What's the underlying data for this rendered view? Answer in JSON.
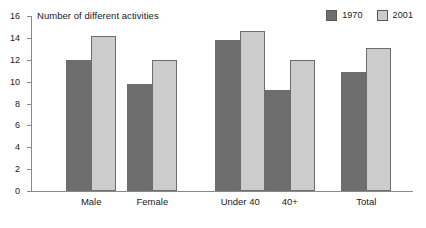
{
  "chart_data": {
    "type": "bar",
    "title": "Number of different activities",
    "xlabel": "",
    "ylabel": "",
    "ylim": [
      0,
      16
    ],
    "yticks": [
      0,
      2,
      4,
      6,
      8,
      10,
      12,
      14,
      16
    ],
    "grid": false,
    "legend_position": "top-right",
    "categories": [
      "Male",
      "Female",
      "Under 40",
      "40+",
      "Total"
    ],
    "series": [
      {
        "name": "1970",
        "color": "#6e6e6e",
        "values": [
          12.0,
          9.8,
          13.8,
          9.2,
          10.9
        ]
      },
      {
        "name": "2001",
        "color": "#cccccc",
        "values": [
          14.2,
          12.0,
          14.6,
          12.0,
          13.1
        ]
      }
    ]
  },
  "legend": {
    "items": [
      {
        "label": "1970",
        "color": "#6e6e6e"
      },
      {
        "label": "2001",
        "color": "#cccccc"
      }
    ]
  },
  "axis": {
    "title": "Number of different activities",
    "y_tick_labels": [
      "16",
      "14",
      "12",
      "10",
      "8",
      "6",
      "4",
      "2",
      "0"
    ]
  },
  "categories": [
    "Male",
    "Female",
    "Under 40",
    "40+",
    "Total"
  ],
  "colors": {
    "series_1970": "#6e6e6e",
    "series_2001": "#cccccc",
    "bar_border": "#6d6d6d",
    "axis": "#8a8a8a",
    "text": "#1a1a1a",
    "background": "#ffffff"
  }
}
